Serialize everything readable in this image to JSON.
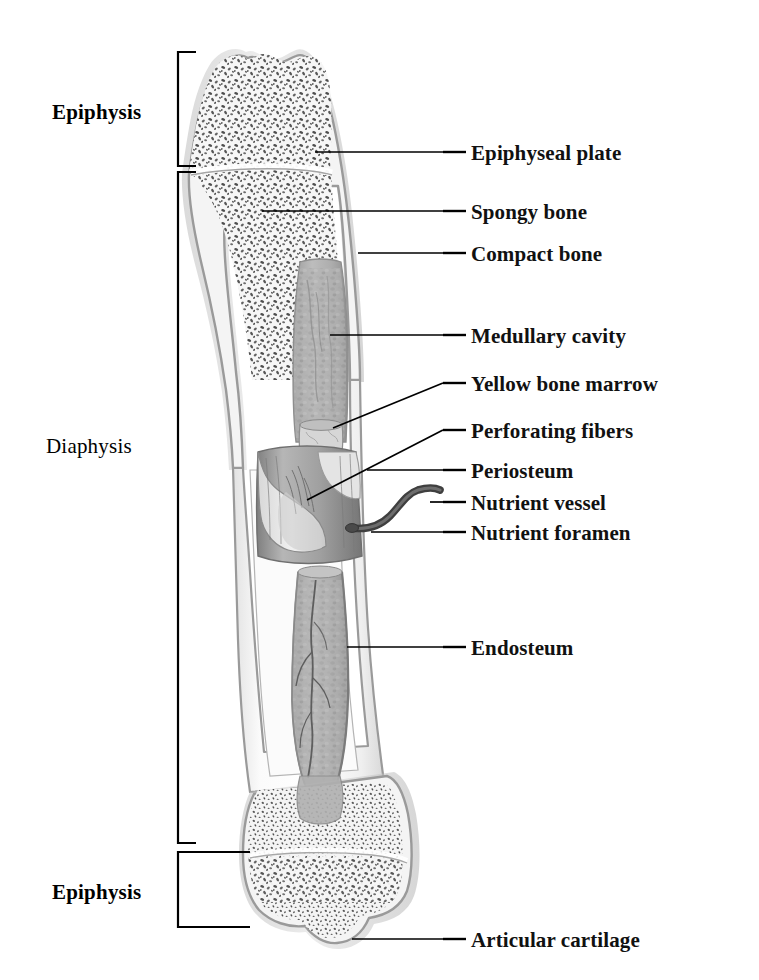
{
  "figure": {
    "background_color": "#ffffff",
    "line_color": "#000000",
    "bone_outline_color": "#8c8c8c",
    "bone_fill_color": "#f2f2f2",
    "cartilage_color": "#c9c9c9",
    "spongy_bone_color": "#5a5a5a",
    "marrow_color": "#a9a9a9",
    "periosteum_color": "#9a9a9a",
    "vessel_color": "#4a4a4a"
  },
  "regions": [
    {
      "id": "epiphysis-proximal",
      "label": "Epiphysis",
      "weight": "strong",
      "label_x": 52,
      "label_y": 100,
      "bracket_x": 178,
      "bracket_top": 52,
      "bracket_bottom": 166
    },
    {
      "id": "diaphysis",
      "label": "Diaphysis",
      "weight": "light",
      "label_x": 46,
      "label_y": 434,
      "bracket_x": 178,
      "bracket_top": 172,
      "bracket_bottom": 843
    },
    {
      "id": "epiphysis-distal",
      "label": "Epiphysis",
      "weight": "strong",
      "label_x": 52,
      "label_y": 880,
      "bracket_x": 178,
      "bracket_top": 852,
      "bracket_bottom": 927
    }
  ],
  "callouts": [
    {
      "id": "epiphyseal-plate",
      "label": "Epiphyseal plate",
      "text_x": 471,
      "text_y": 141,
      "dash_x1": 443,
      "dash_x2": 466,
      "dash_y": 152,
      "leader_x1": 315,
      "leader_y1": 152,
      "leader_x2": 443,
      "leader_y2": 152
    },
    {
      "id": "spongy-bone",
      "label": "Spongy bone",
      "text_x": 471,
      "text_y": 200,
      "dash_x1": 443,
      "dash_x2": 466,
      "dash_y": 211,
      "leader_x1": 262,
      "leader_y1": 211,
      "leader_x2": 443,
      "leader_y2": 211
    },
    {
      "id": "compact-bone",
      "label": "Compact bone",
      "text_x": 471,
      "text_y": 242,
      "dash_x1": 443,
      "dash_x2": 466,
      "dash_y": 253,
      "leader_x1": 358,
      "leader_y1": 253,
      "leader_x2": 443,
      "leader_y2": 253
    },
    {
      "id": "medullary-cavity",
      "label": "Medullary cavity",
      "text_x": 471,
      "text_y": 324,
      "dash_x1": 443,
      "dash_x2": 466,
      "dash_y": 335,
      "leader_x1": 330,
      "leader_y1": 335,
      "leader_x2": 443,
      "leader_y2": 335
    },
    {
      "id": "yellow-bone-marrow",
      "label": "Yellow bone marrow",
      "text_x": 471,
      "text_y": 372,
      "dash_x1": 443,
      "dash_x2": 466,
      "dash_y": 383,
      "leader_x1": 333,
      "leader_y1": 428,
      "leader_x2": 443,
      "leader_y2": 383
    },
    {
      "id": "perforating-fibers",
      "label": "Perforating fibers",
      "text_x": 471,
      "text_y": 419,
      "dash_x1": 443,
      "dash_x2": 466,
      "dash_y": 430,
      "leader_x1": 307,
      "leader_y1": 500,
      "leader_x2": 443,
      "leader_y2": 430
    },
    {
      "id": "periosteum",
      "label": "Periosteum",
      "text_x": 471,
      "text_y": 459,
      "dash_x1": 443,
      "dash_x2": 466,
      "dash_y": 470,
      "leader_x1": 367,
      "leader_y1": 470,
      "leader_x2": 443,
      "leader_y2": 470
    },
    {
      "id": "nutrient-vessel",
      "label": "Nutrient vessel",
      "text_x": 471,
      "text_y": 491,
      "dash_x1": 443,
      "dash_x2": 466,
      "dash_y": 502,
      "leader_x1": 430,
      "leader_y1": 502,
      "leader_x2": 443,
      "leader_y2": 502
    },
    {
      "id": "nutrient-foramen",
      "label": "Nutrient foramen",
      "text_x": 471,
      "text_y": 521,
      "dash_x1": 443,
      "dash_x2": 466,
      "dash_y": 532,
      "leader_x1": 371,
      "leader_y1": 532,
      "leader_x2": 443,
      "leader_y2": 532
    },
    {
      "id": "endosteum",
      "label": "Endosteum",
      "text_x": 471,
      "text_y": 636,
      "dash_x1": 443,
      "dash_x2": 466,
      "dash_y": 647,
      "leader_x1": 347,
      "leader_y1": 647,
      "leader_x2": 443,
      "leader_y2": 647
    },
    {
      "id": "articular-cartilage",
      "label": "Articular cartilage",
      "text_x": 471,
      "text_y": 928,
      "dash_x1": 443,
      "dash_x2": 466,
      "dash_y": 939,
      "leader_x1": 352,
      "leader_y1": 939,
      "leader_x2": 443,
      "leader_y2": 939
    }
  ]
}
